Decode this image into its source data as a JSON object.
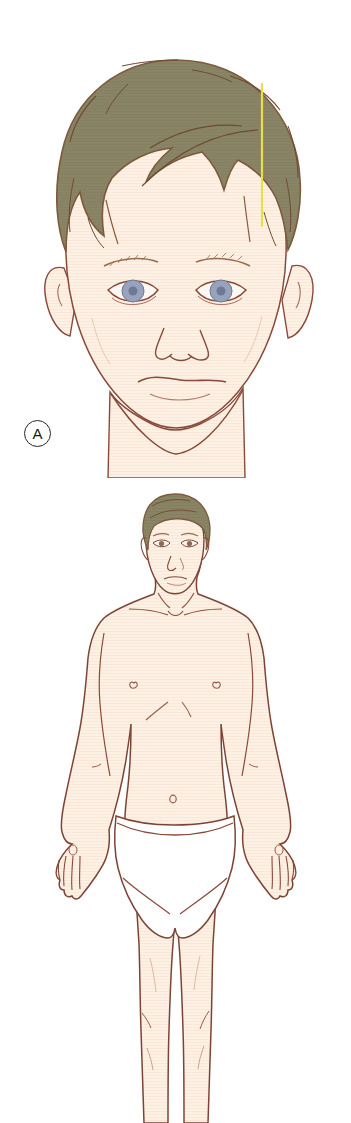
{
  "figure": {
    "panels": [
      {
        "id": "A",
        "label": "A",
        "name": "head-front-view",
        "description": "Close-up anterior view of a boy's head and face with vertical midline reference line through the hair",
        "subject": "child head, anterior view",
        "annotations": [
          {
            "name": "vertical-reference-line",
            "color": "#e8e04a",
            "orientation": "vertical",
            "x": 262,
            "y_start": 84,
            "y_end": 226
          }
        ]
      },
      {
        "id": "B",
        "label": "",
        "name": "body-front-view",
        "description": "Full anterior view of an adult male figure wearing white briefs, arms at sides",
        "subject": "adult male body, anterior view",
        "annotations": []
      }
    ]
  },
  "colors": {
    "background": "#ffffff",
    "skin_fill": "#fdf1e4",
    "skin_shade": "#f7e6d4",
    "outline": "#8a4a39",
    "hair_fill": "#8a8466",
    "hair_outline": "#7d5a3c",
    "hair_strand": "#6d4b30",
    "eye_iris": "#97a3bd",
    "eye_pupil": "#6e7a95",
    "eye_white": "#fbf7f2",
    "brow": "#9a6b4a",
    "lip_line": "#9e5544",
    "underwear_fill": "#ffffff",
    "underwear_outline": "#7d4436",
    "reference_line": "#e8e04a",
    "label_circle": "#262626",
    "label_text": "#1a1a1a"
  },
  "features": {
    "head": {
      "hair": "short wavy brown-olive hair with fringe",
      "eyes": "pair of blue-grey eyes",
      "eyebrows": "two light brown eyebrows",
      "ears": "left and right ears partly covered by hair",
      "nose": "small nose with nostrils",
      "mouth": "closed smiling mouth",
      "neck": "neck and upper shoulders"
    },
    "body": {
      "head": "short brown hair, face with eyes nose and mouth",
      "neck": "neck with sternocleidomastoid lines",
      "clavicles": "left and right clavicle lines",
      "nipples": "left and right nipple",
      "ribcage": "costal margin line",
      "navel": "umbilicus",
      "arms": "both arms hanging at sides",
      "hands": "both hands with fingers",
      "underwear": "white briefs",
      "legs": "both legs with knee creases"
    }
  }
}
